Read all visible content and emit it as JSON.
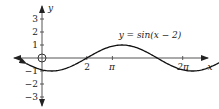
{
  "figure": {
    "function_label": "y = sin(x − 2)",
    "x_axis_label": "x",
    "y_axis_label": "y",
    "x_ticks": [
      {
        "value": 2,
        "label": "2"
      },
      {
        "value": 3.14159,
        "label": "π"
      },
      {
        "value": 6.28318,
        "label": "2π"
      }
    ],
    "y_ticks": [
      {
        "value": 3,
        "label": "3"
      },
      {
        "value": 2,
        "label": "2"
      },
      {
        "value": 1,
        "label": "1"
      },
      {
        "value": -1,
        "label": "−1"
      },
      {
        "value": -2,
        "label": "−2"
      },
      {
        "value": -3,
        "label": "−3"
      }
    ],
    "origin_marker": "open-circle",
    "colors": {
      "axis": "#555555",
      "curve": "#111111",
      "text": "#222222"
    }
  },
  "chart_data": {
    "type": "line",
    "title": "y = sin(x − 2)",
    "xlabel": "x",
    "ylabel": "y",
    "function": "sin(x - 2)",
    "x_range": [
      -0.7,
      9.9
    ],
    "ylim": [
      -3.5,
      3.5
    ],
    "series": [
      {
        "name": "y = sin(x − 2)",
        "x": [
          -0.6,
          0,
          0.5,
          1,
          1.5,
          2,
          2.5,
          3,
          3.57,
          4,
          4.5,
          5,
          5.5,
          6,
          6.5,
          7,
          7.5,
          8,
          8.5,
          9,
          9.5,
          9.9
        ],
        "values": [
          -0.52,
          -0.91,
          -1.0,
          -0.84,
          -0.48,
          0,
          0.48,
          0.84,
          1.0,
          0.91,
          0.6,
          0.14,
          -0.35,
          -0.76,
          -0.98,
          -0.96,
          -0.71,
          -0.28,
          0.22,
          0.66,
          0.94,
          1.0
        ]
      }
    ],
    "grid": false,
    "legend": "inline label above curve"
  }
}
